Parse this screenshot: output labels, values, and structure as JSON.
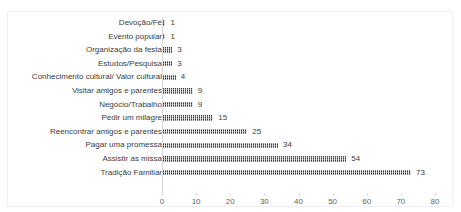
{
  "top_remnant_text": "",
  "chart_data": {
    "type": "bar",
    "orientation": "horizontal",
    "title": "",
    "xlabel": "",
    "ylabel": "",
    "xlim": [
      0,
      80
    ],
    "xticks": [
      0,
      10,
      20,
      30,
      40,
      50,
      60,
      70,
      80
    ],
    "grid": false,
    "legend": "none",
    "bar_color": "#3f3f3f",
    "categories": [
      "Devoção/Fé",
      "Evento popular",
      "Organização da festa",
      "Estudos/Pesquisa",
      "Conhecimento cultural/ Valor cultural",
      "Visitar amigos e parentes",
      "Negócio/Trabalho",
      "Pedir um milagre",
      "Reencontrar amigos e parentes",
      "Pagar uma promessa",
      "Assistir as missa",
      "Tradição Familiar"
    ],
    "values": [
      1,
      1,
      3,
      3,
      4,
      9,
      9,
      15,
      25,
      34,
      54,
      73
    ],
    "data_labels": [
      "1",
      "1",
      "3",
      "3",
      "4",
      "9",
      "9",
      "15",
      "25",
      "34",
      "54",
      "73"
    ],
    "tick_labels": [
      "0",
      "10",
      "20",
      "30",
      "40",
      "50",
      "60",
      "70",
      "80"
    ]
  }
}
